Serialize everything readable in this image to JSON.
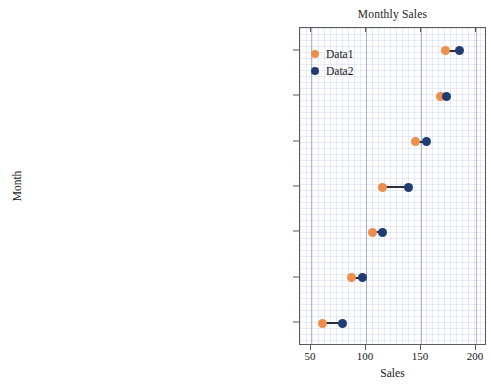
{
  "chart_data": {
    "type": "scatter",
    "title": "Monthly Sales",
    "xlabel": "Sales",
    "ylabel": "Month",
    "xlim": [
      40,
      210
    ],
    "grid": true,
    "legend_position": "top-left",
    "legend": [
      "Data1",
      "Data2"
    ],
    "series_colors": {
      "Data1": "#ed8e4a",
      "Data2": "#1f3d73"
    },
    "connector_color": "#2b2b3d",
    "xticks": [
      50,
      100,
      150,
      200
    ],
    "categories": [
      "hsa03780:Adipocylockine signaling pathway",
      "hsa03850:AGE-RAGE signaling pathway in diabetic complications",
      "has03584:Toxoplasmosis",
      "hsa03208:Hepatitis B",
      "hsa03820:Human T-cell leukemia virus 1 infection",
      "hsa03198:Espstein-Barr virus infection",
      "hsa0329:inflammatory bowel disease"
    ],
    "series": [
      {
        "name": "Data1",
        "values": [
          172,
          168,
          145,
          115,
          106,
          87,
          60
        ]
      },
      {
        "name": "Data2",
        "values": [
          185,
          173,
          155,
          139,
          115,
          97,
          79
        ]
      }
    ]
  }
}
